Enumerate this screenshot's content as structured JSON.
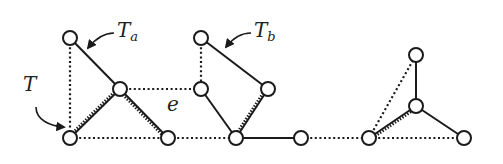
{
  "diagram": {
    "colors": {
      "stroke": "#1a1a1a",
      "node_fill": "#ffffff",
      "background": "#ffffff"
    },
    "node_radius": 7,
    "nodes": [
      {
        "id": "A",
        "x": 70,
        "y": 38
      },
      {
        "id": "B",
        "x": 120,
        "y": 89
      },
      {
        "id": "C",
        "x": 70,
        "y": 138
      },
      {
        "id": "D",
        "x": 168,
        "y": 138
      },
      {
        "id": "E",
        "x": 201,
        "y": 38
      },
      {
        "id": "F",
        "x": 201,
        "y": 89
      },
      {
        "id": "G",
        "x": 268,
        "y": 89
      },
      {
        "id": "H",
        "x": 236,
        "y": 138
      },
      {
        "id": "I",
        "x": 301,
        "y": 138
      },
      {
        "id": "J",
        "x": 369,
        "y": 138
      },
      {
        "id": "K",
        "x": 416,
        "y": 55
      },
      {
        "id": "L",
        "x": 416,
        "y": 106
      },
      {
        "id": "M",
        "x": 464,
        "y": 138
      }
    ],
    "edges": [
      {
        "from": "A",
        "to": "C",
        "style": "dotted"
      },
      {
        "from": "A",
        "to": "B",
        "style": "solid"
      },
      {
        "from": "B",
        "to": "C",
        "style": "hatched"
      },
      {
        "from": "B",
        "to": "D",
        "style": "hatched"
      },
      {
        "from": "B",
        "to": "F",
        "style": "dotted"
      },
      {
        "from": "C",
        "to": "D",
        "style": "dotted"
      },
      {
        "from": "D",
        "to": "H",
        "style": "dotted"
      },
      {
        "from": "E",
        "to": "F",
        "style": "dotted"
      },
      {
        "from": "E",
        "to": "G",
        "style": "solid"
      },
      {
        "from": "F",
        "to": "H",
        "style": "solid"
      },
      {
        "from": "G",
        "to": "H",
        "style": "hatched"
      },
      {
        "from": "H",
        "to": "I",
        "style": "solid"
      },
      {
        "from": "I",
        "to": "J",
        "style": "dotted"
      },
      {
        "from": "J",
        "to": "K",
        "style": "dotted"
      },
      {
        "from": "J",
        "to": "L",
        "style": "hatched"
      },
      {
        "from": "K",
        "to": "L",
        "style": "solid"
      },
      {
        "from": "L",
        "to": "M",
        "style": "solid"
      },
      {
        "from": "J",
        "to": "M",
        "style": "dotted"
      }
    ],
    "labels": {
      "T": {
        "main": "T",
        "sub": ""
      },
      "Ta": {
        "main": "T",
        "sub": "a"
      },
      "Tb": {
        "main": "T",
        "sub": "b"
      },
      "e": {
        "main": "e",
        "sub": ""
      }
    },
    "arrows": [
      {
        "name": "T-pointer",
        "path": "M36,107 C36,120 50,126 64,127"
      },
      {
        "name": "Ta-pointer",
        "path": "M114,33 C104,33 96,38 88,48"
      },
      {
        "name": "Tb-pointer",
        "path": "M251,33 C241,33 233,38 226,47"
      }
    ]
  }
}
